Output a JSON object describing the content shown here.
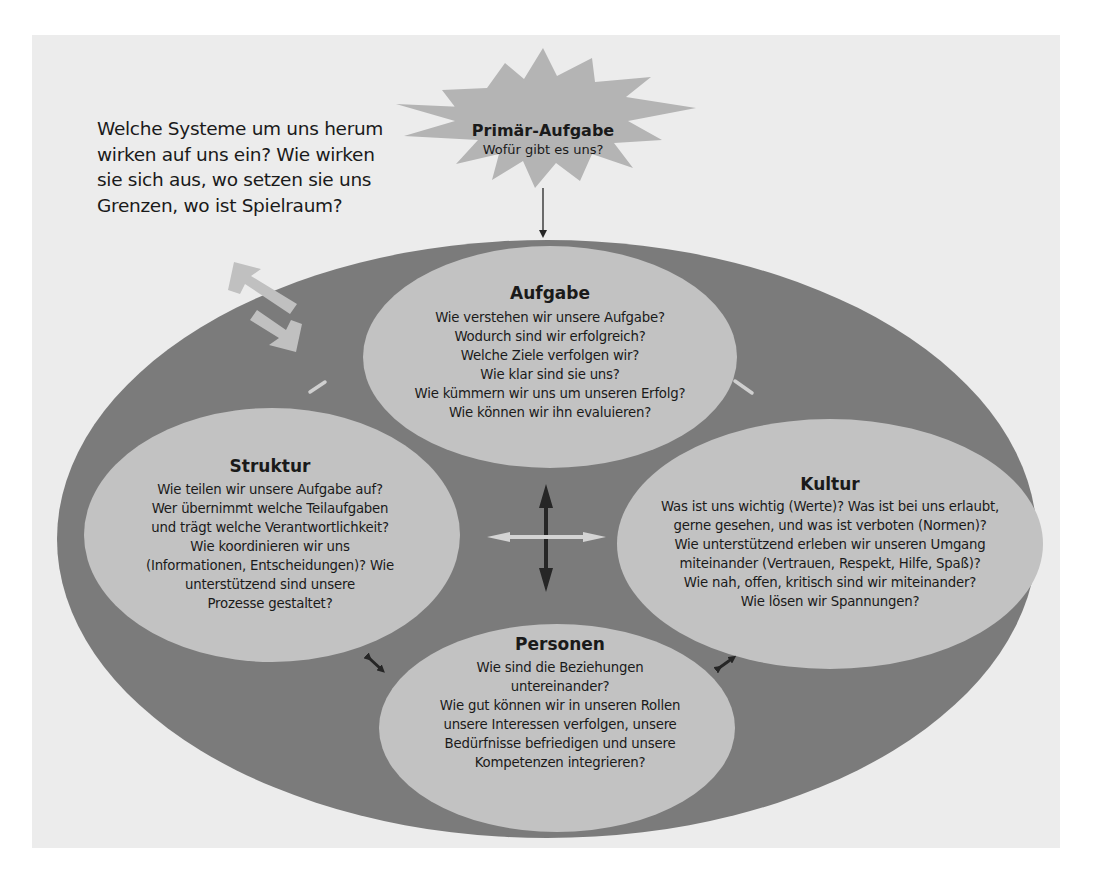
{
  "colors": {
    "page_background": "#ffffff",
    "panel_background": "#ececec",
    "outer_ellipse": "#7b7b7b",
    "inner_ellipses": "#c2c2c2",
    "starburst": "#b4b4b4",
    "light_arrow": "#c8c8c8",
    "dark_arrow": "#262626",
    "text": "#1a1a1a"
  },
  "environment": {
    "lines": [
      "Welche Systeme um uns herum",
      "wirken auf uns ein? Wie wirken",
      "sie sich aus, wo setzen sie uns",
      "Grenzen, wo ist Spielraum?"
    ]
  },
  "primary_task": {
    "title": "Primär-Aufgabe",
    "subtitle": "Wofür gibt es uns?"
  },
  "nodes": {
    "aufgabe": {
      "title": "Aufgabe",
      "lines": [
        "Wie verstehen wir unsere Aufgabe?",
        "Wodurch sind wir erfolgreich?",
        "Welche Ziele verfolgen wir?",
        "Wie klar sind sie uns?",
        "Wie kümmern wir uns um unseren Erfolg?",
        "Wie können wir ihn evaluieren?"
      ]
    },
    "struktur": {
      "title": "Struktur",
      "lines": [
        "Wie teilen wir unsere Aufgabe auf?",
        "Wer übernimmt welche Teilaufgaben",
        "und trägt welche Verantwortlichkeit?",
        "Wie koordinieren wir uns",
        "(Informationen, Entscheidungen)? Wie",
        "unterstützend sind unsere",
        "Prozesse gestaltet?"
      ]
    },
    "kultur": {
      "title": "Kultur",
      "lines": [
        "Was ist uns wichtig (Werte)? Was ist bei uns erlaubt,",
        "gerne gesehen, und was ist verboten (Normen)?",
        "Wie unterstützend erleben wir unseren Umgang",
        "miteinander (Vertrauen, Respekt, Hilfe, Spaß)?",
        "Wie nah, offen, kritisch sind wir miteinander?",
        "Wie lösen wir Spannungen?"
      ]
    },
    "personen": {
      "title": "Personen",
      "lines": [
        "Wie sind die Beziehungen",
        "untereinander?",
        "Wie gut können wir in unseren Rollen",
        "unsere Interessen verfolgen, unsere",
        "Bedürfnisse befriedigen und unsere",
        "Kompetenzen integrieren?"
      ]
    }
  }
}
